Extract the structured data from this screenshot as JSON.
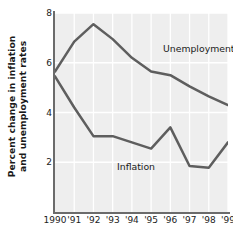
{
  "chart_data": {
    "type": "line",
    "title": "",
    "subtitle": "",
    "xlabel": "",
    "ylabel": "Percent change in inflation and unemployment rates",
    "ylabel_line1": "Percent change in inflation",
    "ylabel_line2": "and unemployment rates",
    "x": [
      1990,
      1991,
      1992,
      1993,
      1994,
      1995,
      1996,
      1997,
      1998,
      1999
    ],
    "categories": [
      "1990",
      "'91",
      "'92",
      "'93",
      "'94",
      "'95",
      "'96",
      "'97",
      "'98",
      "'99"
    ],
    "xticklabels": [
      "1990",
      "'91",
      "'92",
      "'93",
      "'94",
      "'95",
      "'96",
      "'97",
      "'98",
      "'99"
    ],
    "yticks": [
      2,
      4,
      6,
      8
    ],
    "yticklabels": [
      "2",
      "4",
      "6",
      "8"
    ],
    "ylim": [
      0,
      8
    ],
    "xlim": [
      1990,
      1999
    ],
    "grid": "both",
    "grid_color": "#ffffff",
    "plot_background": "#eeeeee",
    "line_color": "#5e5e5e",
    "legend": "inline-annotations",
    "series": [
      {
        "name": "Unemployment",
        "values": [
          5.65,
          6.85,
          7.55,
          6.95,
          6.2,
          5.65,
          5.5,
          5.05,
          4.65,
          4.3
        ]
      },
      {
        "name": "Inflation",
        "values": [
          5.45,
          4.2,
          3.05,
          3.05,
          2.8,
          2.55,
          3.4,
          1.85,
          1.78,
          2.8
        ]
      }
    ],
    "annotations": [
      {
        "text": "Unemployment",
        "x": 1994.0,
        "y": 7.0
      },
      {
        "text": "Inflation",
        "x": 1991.3,
        "y": 2.5
      }
    ]
  },
  "axis": {
    "y_tick_2": "2",
    "y_tick_4": "4",
    "y_tick_6": "6",
    "y_tick_8": "8"
  },
  "labels": {
    "unemployment": "Unemployment",
    "inflation": "Inflation"
  }
}
